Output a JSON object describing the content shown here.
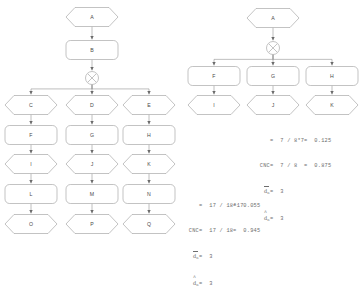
{
  "diagram": {
    "type": "flowchart",
    "left_graph": {
      "name": "left-process-tree",
      "nodes": [
        {
          "id": "A",
          "label": "A",
          "shape": "hexagon",
          "x": 92,
          "y": 17
        },
        {
          "id": "B",
          "label": "B",
          "shape": "rounded",
          "x": 92,
          "y": 50
        },
        {
          "id": "GW",
          "label": "X",
          "shape": "gateway",
          "x": 92,
          "y": 78
        },
        {
          "id": "C",
          "label": "C",
          "shape": "hexagon",
          "x": 31,
          "y": 105
        },
        {
          "id": "D",
          "label": "D",
          "shape": "hexagon",
          "x": 92,
          "y": 105
        },
        {
          "id": "E",
          "label": "E",
          "shape": "hexagon",
          "x": 149,
          "y": 105
        },
        {
          "id": "F",
          "label": "F",
          "shape": "rounded",
          "x": 31,
          "y": 135
        },
        {
          "id": "G",
          "label": "G",
          "shape": "rounded",
          "x": 92,
          "y": 135
        },
        {
          "id": "H",
          "label": "H",
          "shape": "rounded",
          "x": 149,
          "y": 135
        },
        {
          "id": "I",
          "label": "I",
          "shape": "hexagon",
          "x": 31,
          "y": 164
        },
        {
          "id": "J",
          "label": "J",
          "shape": "hexagon",
          "x": 92,
          "y": 164
        },
        {
          "id": "K",
          "label": "K",
          "shape": "hexagon",
          "x": 149,
          "y": 164
        },
        {
          "id": "L",
          "label": "L",
          "shape": "rounded",
          "x": 31,
          "y": 194
        },
        {
          "id": "M",
          "label": "M",
          "shape": "rounded",
          "x": 92,
          "y": 194
        },
        {
          "id": "N",
          "label": "N",
          "shape": "rounded",
          "x": 149,
          "y": 194
        },
        {
          "id": "O",
          "label": "O",
          "shape": "hexagon",
          "x": 31,
          "y": 224
        },
        {
          "id": "P",
          "label": "P",
          "shape": "hexagon",
          "x": 92,
          "y": 224
        },
        {
          "id": "Q",
          "label": "Q",
          "shape": "hexagon",
          "x": 149,
          "y": 224
        }
      ],
      "edges": [
        {
          "from": "A",
          "to": "B"
        },
        {
          "from": "B",
          "to": "GW"
        },
        {
          "from": "GW",
          "to": "C"
        },
        {
          "from": "GW",
          "to": "D"
        },
        {
          "from": "GW",
          "to": "E"
        },
        {
          "from": "C",
          "to": "F"
        },
        {
          "from": "F",
          "to": "I"
        },
        {
          "from": "I",
          "to": "L"
        },
        {
          "from": "L",
          "to": "O"
        },
        {
          "from": "D",
          "to": "G"
        },
        {
          "from": "G",
          "to": "J"
        },
        {
          "from": "J",
          "to": "M"
        },
        {
          "from": "M",
          "to": "P"
        },
        {
          "from": "E",
          "to": "H"
        },
        {
          "from": "H",
          "to": "K"
        },
        {
          "from": "K",
          "to": "N"
        },
        {
          "from": "N",
          "to": "Q"
        }
      ]
    },
    "right_graph": {
      "name": "right-process-tree",
      "nodes": [
        {
          "id": "A",
          "label": "A",
          "shape": "hexagon",
          "x": 273,
          "y": 18
        },
        {
          "id": "GW",
          "label": "X",
          "shape": "gateway",
          "x": 273,
          "y": 48
        },
        {
          "id": "F",
          "label": "F",
          "shape": "rounded",
          "x": 214,
          "y": 76
        },
        {
          "id": "G",
          "label": "G",
          "shape": "rounded",
          "x": 273,
          "y": 76
        },
        {
          "id": "H",
          "label": "H",
          "shape": "rounded",
          "x": 332,
          "y": 76
        },
        {
          "id": "I",
          "label": "I",
          "shape": "hexagon",
          "x": 214,
          "y": 105
        },
        {
          "id": "J",
          "label": "J",
          "shape": "hexagon",
          "x": 273,
          "y": 105
        },
        {
          "id": "K",
          "label": "K",
          "shape": "hexagon",
          "x": 332,
          "y": 105
        }
      ],
      "edges": [
        {
          "from": "A",
          "to": "GW"
        },
        {
          "from": "GW",
          "to": "F"
        },
        {
          "from": "GW",
          "to": "G"
        },
        {
          "from": "GW",
          "to": "H"
        },
        {
          "from": "F",
          "to": "I"
        },
        {
          "from": "G",
          "to": "J"
        },
        {
          "from": "H",
          "to": "K"
        }
      ]
    }
  },
  "annotations": {
    "right_block": {
      "name": "right-metrics",
      "line1_label": "",
      "line1_expr": "=  7 / 8*7",
      "line1_result": "=  0.125",
      "line2_label": "CNC",
      "line2_expr": "=  7 / 8",
      "line2_result": "=  0.875",
      "line3_var": "d",
      "line3_sub": "C",
      "line3_value": "=  3",
      "line4_var": "d",
      "line4_sub": "C",
      "line4_value": "=  3"
    },
    "bottom_block": {
      "name": "bottom-metrics",
      "line1_label": "",
      "line1_expr": "=  17 / 18*17",
      "line1_result": "=  0.055",
      "line2_label": "CNC",
      "line2_expr": "=  17 / 18",
      "line2_result": "=  0.945",
      "line3_var": "d",
      "line3_sub": "C",
      "line3_value": "=  3",
      "line4_var": "d",
      "line4_sub": "C",
      "line4_value": "=  3"
    }
  },
  "colors": {
    "stroke": "#9a9a9a",
    "text": "#4a4a4a",
    "annotation_text": "#6d6d6d",
    "background": "#ffffff"
  }
}
